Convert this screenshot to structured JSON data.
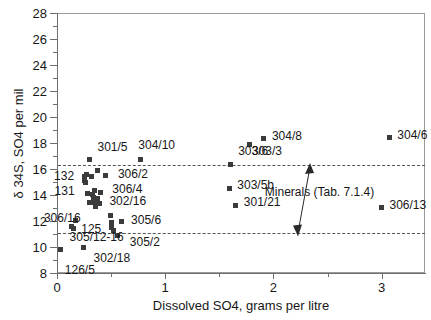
{
  "chart_data": {
    "type": "scatter",
    "title": "",
    "xlabel": "Dissolved SO4, grams per litre",
    "ylabel": "δ 34S, SO4 per mil",
    "xlim": [
      0,
      3.4
    ],
    "ylim": [
      8,
      28
    ],
    "xticks": [
      0,
      1,
      2,
      3
    ],
    "xticklabels": [
      "0",
      "1",
      "2",
      "3"
    ],
    "xminorticks": [
      0.5,
      1.5,
      2.5
    ],
    "yticks": [
      8,
      10,
      12,
      14,
      16,
      18,
      20,
      22,
      24,
      26,
      28
    ],
    "yticklabels": [
      "8",
      "10",
      "12",
      "14",
      "16",
      "18",
      "20",
      "22",
      "24",
      "26",
      "28"
    ],
    "yminorticks": [
      9,
      11,
      13,
      15,
      17,
      19,
      21,
      23,
      25,
      27
    ],
    "grid": false,
    "legend": "none",
    "marker": "filled-square",
    "marker_color": "#3b3b3b",
    "reference_lines": [
      {
        "name": "minerals-upper",
        "y": 16.3
      },
      {
        "name": "minerals-lower",
        "y": 11.1
      }
    ],
    "annotations": [
      {
        "name": "minerals-band",
        "text": "Minerals (Tab. 7.1.4)",
        "x": 1.92,
        "y": 14.2,
        "arrow": {
          "from_y": 16.3,
          "to_y": 11.1,
          "at_x": 2.28,
          "double_headed": true
        }
      }
    ],
    "points": [
      {
        "label": "126/5",
        "x": 0.035,
        "y": 9.8,
        "label_dx": 4,
        "label_dy": 20
      },
      {
        "label": "305/12-16",
        "x": 0.135,
        "y": 11.55,
        "label_dx": -2,
        "label_dy": 10
      },
      {
        "label": "125",
        "x": 0.15,
        "y": 11.45,
        "label_dx": 8,
        "label_dy": 1
      },
      {
        "label": "306/16",
        "x": 0.175,
        "y": 12.05,
        "label_dx": -32,
        "label_dy": -2
      },
      {
        "label": "302/18",
        "x": 0.245,
        "y": 9.95,
        "label_dx": 10,
        "label_dy": 10
      },
      {
        "label": "132",
        "x": 0.25,
        "y": 15.45,
        "label_dx": -30,
        "label_dy": 0
      },
      {
        "label": "131",
        "x": 0.255,
        "y": 15.15,
        "label_dx": -30,
        "label_dy": 11
      },
      {
        "label": "",
        "x": 0.262,
        "y": 14.95,
        "label_dx": 0,
        "label_dy": 0
      },
      {
        "label": "",
        "x": 0.27,
        "y": 15.6,
        "label_dx": 0,
        "label_dy": 0
      },
      {
        "label": "",
        "x": 0.285,
        "y": 14.15,
        "label_dx": 0,
        "label_dy": 0
      },
      {
        "label": "",
        "x": 0.3,
        "y": 13.45,
        "label_dx": 0,
        "label_dy": 0
      },
      {
        "label": "",
        "x": 0.318,
        "y": 15.45,
        "label_dx": 0,
        "label_dy": 0
      },
      {
        "label": "",
        "x": 0.33,
        "y": 14.05,
        "label_dx": 0,
        "label_dy": 0
      },
      {
        "label": "",
        "x": 0.34,
        "y": 13.8,
        "label_dx": 0,
        "label_dy": 0
      },
      {
        "label": "",
        "x": 0.345,
        "y": 13.45,
        "label_dx": 0,
        "label_dy": 0
      },
      {
        "label": "",
        "x": 0.35,
        "y": 14.35,
        "label_dx": 0,
        "label_dy": 0
      },
      {
        "label": "",
        "x": 0.358,
        "y": 13.15,
        "label_dx": 0,
        "label_dy": 0
      },
      {
        "label": "",
        "x": 0.37,
        "y": 15.85,
        "label_dx": 0,
        "label_dy": 0
      },
      {
        "label": "",
        "x": 0.375,
        "y": 13.7,
        "label_dx": 0,
        "label_dy": 0
      },
      {
        "label": "302/16",
        "x": 0.392,
        "y": 13.35,
        "label_dx": 10,
        "label_dy": -2
      },
      {
        "label": "306/4",
        "x": 0.4,
        "y": 14.2,
        "label_dx": 12,
        "label_dy": -3
      },
      {
        "label": "306/2",
        "x": 0.452,
        "y": 15.5,
        "label_dx": 12,
        "label_dy": -2
      },
      {
        "label": "301/5",
        "x": 0.3,
        "y": 16.7,
        "label_dx": 8,
        "label_dy": -13
      },
      {
        "label": "",
        "x": 0.492,
        "y": 12.4,
        "label_dx": 0,
        "label_dy": 0
      },
      {
        "label": "",
        "x": 0.5,
        "y": 11.85,
        "label_dx": 0,
        "label_dy": 0
      },
      {
        "label": "",
        "x": 0.508,
        "y": 11.5,
        "label_dx": 0,
        "label_dy": 0
      },
      {
        "label": "",
        "x": 0.518,
        "y": 11.25,
        "label_dx": 0,
        "label_dy": 0
      },
      {
        "label": "305/2",
        "x": 0.562,
        "y": 10.85,
        "label_dx": 12,
        "label_dy": 6
      },
      {
        "label": "305/6",
        "x": 0.592,
        "y": 11.95,
        "label_dx": 10,
        "label_dy": -2
      },
      {
        "label": "304/10",
        "x": 0.77,
        "y": 16.72,
        "label_dx": -2,
        "label_dy": -15
      },
      {
        "label": "303/6",
        "x": 1.6,
        "y": 16.35,
        "label_dx": 8,
        "label_dy": -13
      },
      {
        "label": "303/5b",
        "x": 1.592,
        "y": 14.52,
        "label_dx": 8,
        "label_dy": -3
      },
      {
        "label": "301/21",
        "x": 1.652,
        "y": 13.22,
        "label_dx": 8,
        "label_dy": -3
      },
      {
        "label": "303/3",
        "x": 1.782,
        "y": 17.88,
        "label_dx": 2,
        "label_dy": 6
      },
      {
        "label": "304/8",
        "x": 1.912,
        "y": 18.32,
        "label_dx": 8,
        "label_dy": -3
      },
      {
        "label": "306/13",
        "x": 2.998,
        "y": 13.02,
        "label_dx": 8,
        "label_dy": -3
      },
      {
        "label": "304/6",
        "x": 3.07,
        "y": 18.4,
        "label_dx": 8,
        "label_dy": -3
      }
    ]
  }
}
